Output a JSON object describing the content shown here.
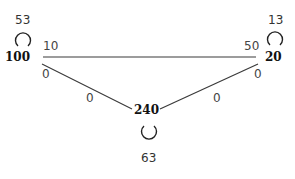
{
  "diagram": {
    "type": "weighted-graph",
    "nodes": [
      {
        "id": "A",
        "label": "100",
        "self_loop": "53"
      },
      {
        "id": "B",
        "label": "20",
        "self_loop": "13"
      },
      {
        "id": "C",
        "label": "240",
        "self_loop": "63"
      }
    ],
    "edges": [
      {
        "from": "A",
        "to": "B",
        "label_near_from": "10",
        "label_near_to": "50"
      },
      {
        "from": "A",
        "to": "C",
        "label_near_from": "0",
        "label_near_to": "0"
      },
      {
        "from": "B",
        "to": "C",
        "label_near_from": "0",
        "label_near_to": "0"
      }
    ]
  }
}
